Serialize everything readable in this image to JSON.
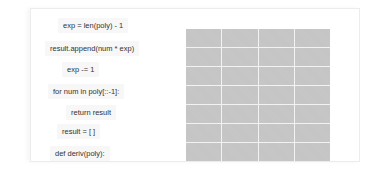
{
  "code_blocks": [
    {
      "text": "exp = len(poly) - 1",
      "x": 58,
      "y": 18
    },
    {
      "text": "result.append(num * exp)",
      "x": 45,
      "y": 41
    },
    {
      "text": "exp -= 1",
      "x": 62,
      "y": 62
    },
    {
      "text": "for num in poly[::-1]:",
      "x": 48,
      "y": 84
    },
    {
      "text": "return result",
      "x": 66,
      "y": 105
    },
    {
      "text": "result = [ ]",
      "x": 57,
      "y": 124
    },
    {
      "text": "def deriv(poly):",
      "x": 50,
      "y": 146
    }
  ],
  "drop_grid": {
    "columns": 4,
    "rows": 7,
    "cell_color": "#c4c4c4",
    "line_color": "#f2f2f2"
  }
}
